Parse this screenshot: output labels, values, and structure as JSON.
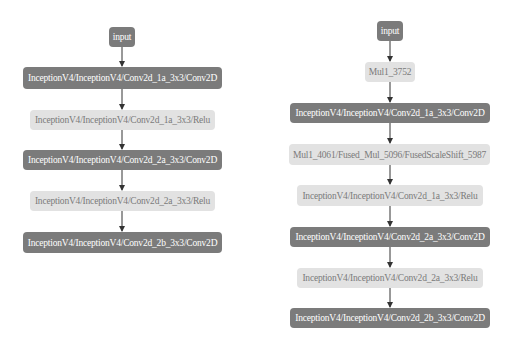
{
  "colors": {
    "dark_node": "#7b7b7b",
    "light_node": "#e2e2e2",
    "dark_text": "#ffffff",
    "light_text": "#7a7a7a",
    "edge": "#333333"
  },
  "left_graph": {
    "nodes": [
      {
        "id": "input",
        "label": "input",
        "style": "dark"
      },
      {
        "id": "conv1a",
        "label": "InceptionV4/InceptionV4/Conv2d_1a_3x3/Conv2D",
        "style": "dark"
      },
      {
        "id": "relu1a",
        "label": "InceptionV4/InceptionV4/Conv2d_1a_3x3/Relu",
        "style": "light"
      },
      {
        "id": "conv2a",
        "label": "InceptionV4/InceptionV4/Conv2d_2a_3x3/Conv2D",
        "style": "dark"
      },
      {
        "id": "relu2a",
        "label": "InceptionV4/InceptionV4/Conv2d_2a_3x3/Relu",
        "style": "light"
      },
      {
        "id": "conv2b",
        "label": "InceptionV4/InceptionV4/Conv2d_2b_3x3/Conv2D",
        "style": "dark"
      }
    ],
    "edges": [
      [
        "input",
        "conv1a"
      ],
      [
        "conv1a",
        "relu1a"
      ],
      [
        "relu1a",
        "conv2a"
      ],
      [
        "conv2a",
        "relu2a"
      ],
      [
        "relu2a",
        "conv2b"
      ]
    ]
  },
  "right_graph": {
    "nodes": [
      {
        "id": "input",
        "label": "input",
        "style": "dark"
      },
      {
        "id": "mul3752",
        "label": "Mul1_3752",
        "style": "light"
      },
      {
        "id": "conv1a",
        "label": "InceptionV4/InceptionV4/Conv2d_1a_3x3/Conv2D",
        "style": "dark"
      },
      {
        "id": "mul4061",
        "label": "Mul1_4061/Fused_Mul_5096/FusedScaleShift_5987",
        "style": "light"
      },
      {
        "id": "relu1a",
        "label": "InceptionV4/InceptionV4/Conv2d_1a_3x3/Relu",
        "style": "light"
      },
      {
        "id": "conv2a",
        "label": "InceptionV4/InceptionV4/Conv2d_2a_3x3/Conv2D",
        "style": "dark"
      },
      {
        "id": "relu2a",
        "label": "InceptionV4/InceptionV4/Conv2d_2a_3x3/Relu",
        "style": "light"
      },
      {
        "id": "conv2b",
        "label": "InceptionV4/InceptionV4/Conv2d_2b_3x3/Conv2D",
        "style": "dark"
      }
    ],
    "edges": [
      [
        "input",
        "mul3752"
      ],
      [
        "mul3752",
        "conv1a"
      ],
      [
        "conv1a",
        "mul4061"
      ],
      [
        "mul4061",
        "relu1a"
      ],
      [
        "relu1a",
        "conv2a"
      ],
      [
        "conv2a",
        "relu2a"
      ],
      [
        "relu2a",
        "conv2b"
      ]
    ]
  }
}
